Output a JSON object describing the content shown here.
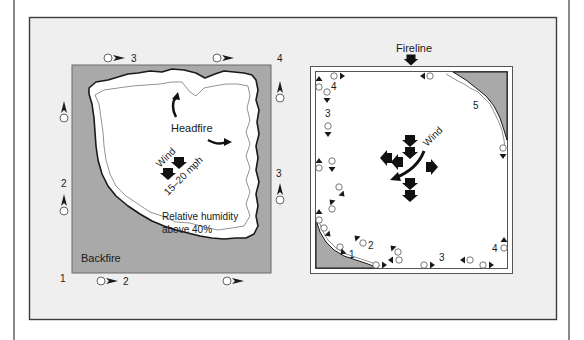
{
  "colors": {
    "page_bg": "#ffffff",
    "panel_bg": "#efefef",
    "panel_border": "#3c3c3c",
    "burned_gray": "#a9a9a9",
    "unburned_white": "#ffffff",
    "ink": "#1a1a1a"
  },
  "left_diagram": {
    "labels": {
      "headfire": "Headfire",
      "wind": "Wind",
      "wind_speed": "15–20 mph",
      "humidity_line1": "Relative humidity",
      "humidity_line2": "above 40%",
      "backfire": "Backfire"
    },
    "ignition_points": [
      {
        "number": "1",
        "position": "bottom-left corner"
      },
      {
        "number": "2",
        "position": "bottom edge, left"
      },
      {
        "number": "2",
        "position": "left edge"
      },
      {
        "number": "3",
        "position": "top edge, left"
      },
      {
        "number": "3",
        "position": "right edge"
      },
      {
        "number": "4",
        "position": "top-right corner"
      }
    ]
  },
  "right_diagram": {
    "labels": {
      "fireline": "Fireline",
      "wind": "Wind"
    },
    "ignition_points": [
      {
        "number": "1",
        "position": "bottom-left"
      },
      {
        "number": "2",
        "position": "bottom-left, inner"
      },
      {
        "number": "3",
        "position": "bottom edge"
      },
      {
        "number": "3",
        "position": "left edge"
      },
      {
        "number": "4",
        "position": "top-left corner"
      },
      {
        "number": "4",
        "position": "bottom-right corner"
      },
      {
        "number": "5",
        "position": "top-right"
      }
    ]
  }
}
